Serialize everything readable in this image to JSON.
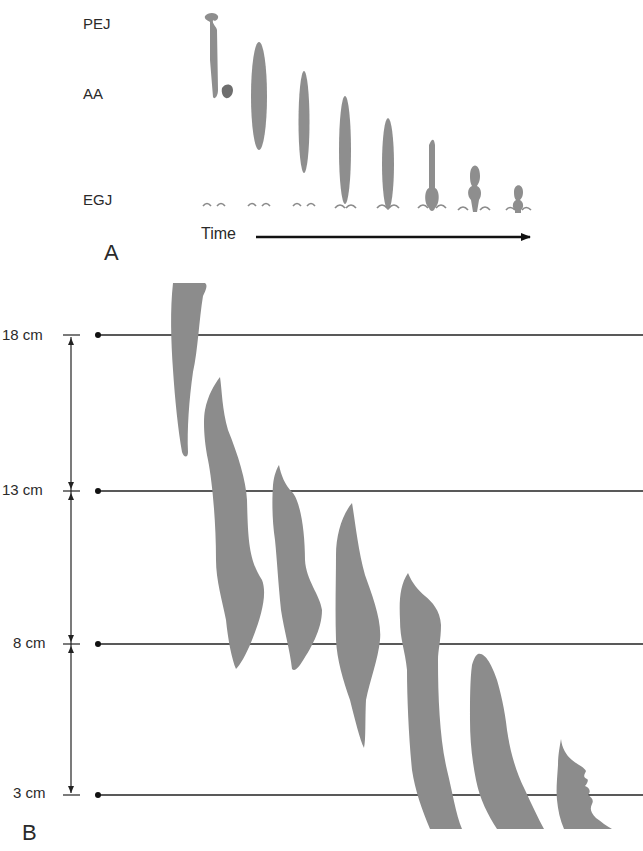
{
  "panel_a": {
    "label": "A",
    "row_labels": {
      "top": "PEJ",
      "middle": "AA",
      "bottom": "EGJ"
    },
    "time_label": "Time",
    "frames": 8
  },
  "panel_b": {
    "label": "B",
    "levels": [
      "18 cm",
      "13 cm",
      "8 cm",
      "3 cm"
    ],
    "bolus_count": 7
  },
  "colors": {
    "bolus": "#8e8e8e",
    "line": "#222222",
    "background": "#ffffff"
  }
}
